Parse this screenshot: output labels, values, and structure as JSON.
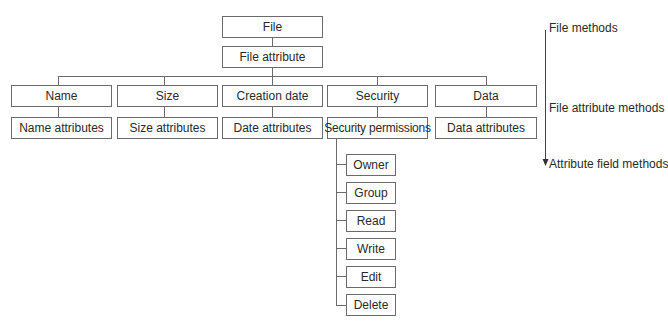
{
  "root": {
    "label": "File"
  },
  "root_child": {
    "label": "File attribute"
  },
  "attributes": [
    {
      "label": "Name",
      "child": "Name attributes"
    },
    {
      "label": "Size",
      "child": "Size attributes"
    },
    {
      "label": "Creation date",
      "child": "Date attributes"
    },
    {
      "label": "Security",
      "child": "Security permissions"
    },
    {
      "label": "Data",
      "child": "Data attributes"
    }
  ],
  "permissions": [
    "Owner",
    "Group",
    "Read",
    "Write",
    "Edit",
    "Delete"
  ],
  "levels": {
    "file_methods": "File methods",
    "file_attribute_methods": "File attribute methods",
    "attribute_field_methods": "Attribute field methods"
  }
}
